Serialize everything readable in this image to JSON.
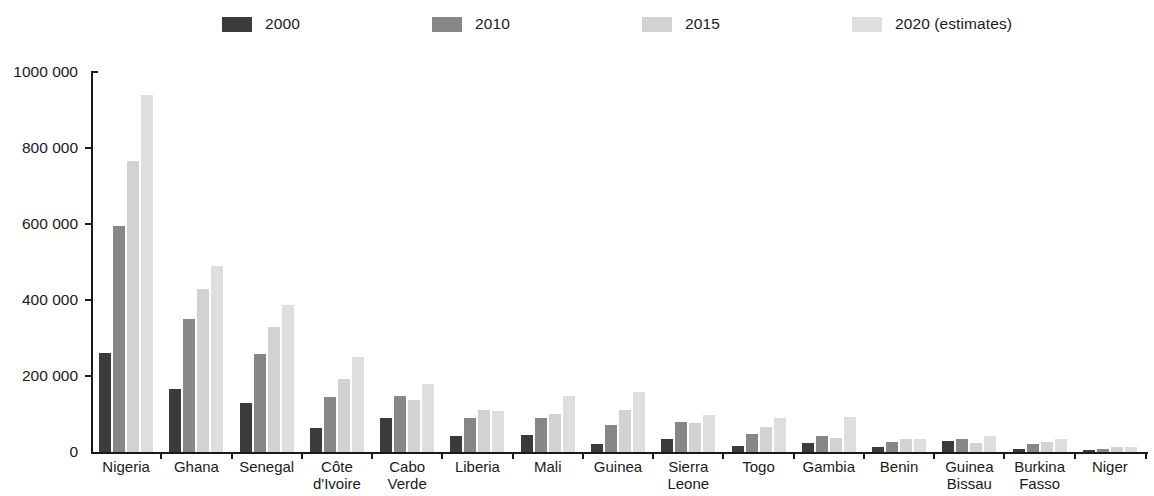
{
  "chart_data": {
    "type": "bar",
    "title": "",
    "subtitle": "",
    "xlabel": "",
    "ylabel": "",
    "ylim": [
      0,
      1000000
    ],
    "ytick_labels": [
      "0",
      "200 000",
      "400 000",
      "600 000",
      "800 000",
      "1000 000"
    ],
    "ytick_values": [
      0,
      200000,
      400000,
      600000,
      800000,
      1000000
    ],
    "grid": false,
    "legend_position": "top",
    "categories": [
      "Nigeria",
      "Ghana",
      "Senegal",
      "Côte\nd'Ivoire",
      "Cabo\nVerde",
      "Liberia",
      "Mali",
      "Guinea",
      "Sierra\nLeone",
      "Togo",
      "Gambia",
      "Benin",
      "Guinea\nBissau",
      "Burkina\nFasso",
      "Niger"
    ],
    "series": [
      {
        "name": "2000",
        "color": "#3b3b3b",
        "values": [
          260000,
          165000,
          130000,
          62000,
          90000,
          42000,
          46000,
          20000,
          33000,
          17000,
          23000,
          13000,
          30000,
          8000,
          4000
        ]
      },
      {
        "name": "2010",
        "color": "#878787",
        "values": [
          595000,
          350000,
          257000,
          145000,
          148000,
          90000,
          90000,
          72000,
          80000,
          47000,
          43000,
          27000,
          35000,
          20000,
          9000
        ]
      },
      {
        "name": "2015",
        "color": "#d2d2d2",
        "values": [
          765000,
          430000,
          330000,
          193000,
          138000,
          110000,
          100000,
          110000,
          77000,
          65000,
          37000,
          34000,
          25000,
          27000,
          12000
        ]
      },
      {
        "name": "2020 (estimates)",
        "color": "#dedede",
        "values": [
          940000,
          490000,
          388000,
          250000,
          180000,
          108000,
          148000,
          158000,
          97000,
          90000,
          93000,
          35000,
          42000,
          35000,
          13000
        ]
      }
    ]
  },
  "legend": {
    "items": [
      {
        "label": "2000",
        "color": "#3b3b3b",
        "x": 222
      },
      {
        "label": "2010",
        "color": "#878787",
        "x": 432
      },
      {
        "label": "2015",
        "color": "#d2d2d2",
        "x": 642
      },
      {
        "label": "2020 (estimates)",
        "color": "#dedede",
        "x": 852
      }
    ]
  }
}
